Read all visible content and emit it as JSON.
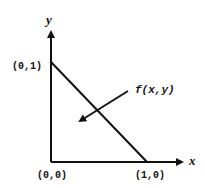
{
  "diagram": {
    "axes": {
      "x_label": "x",
      "y_label": "y"
    },
    "points": {
      "origin": "(0,0)",
      "y_intercept": "(0,1)",
      "x_intercept": "(1,0)"
    },
    "annotation": "f(x,y)"
  }
}
